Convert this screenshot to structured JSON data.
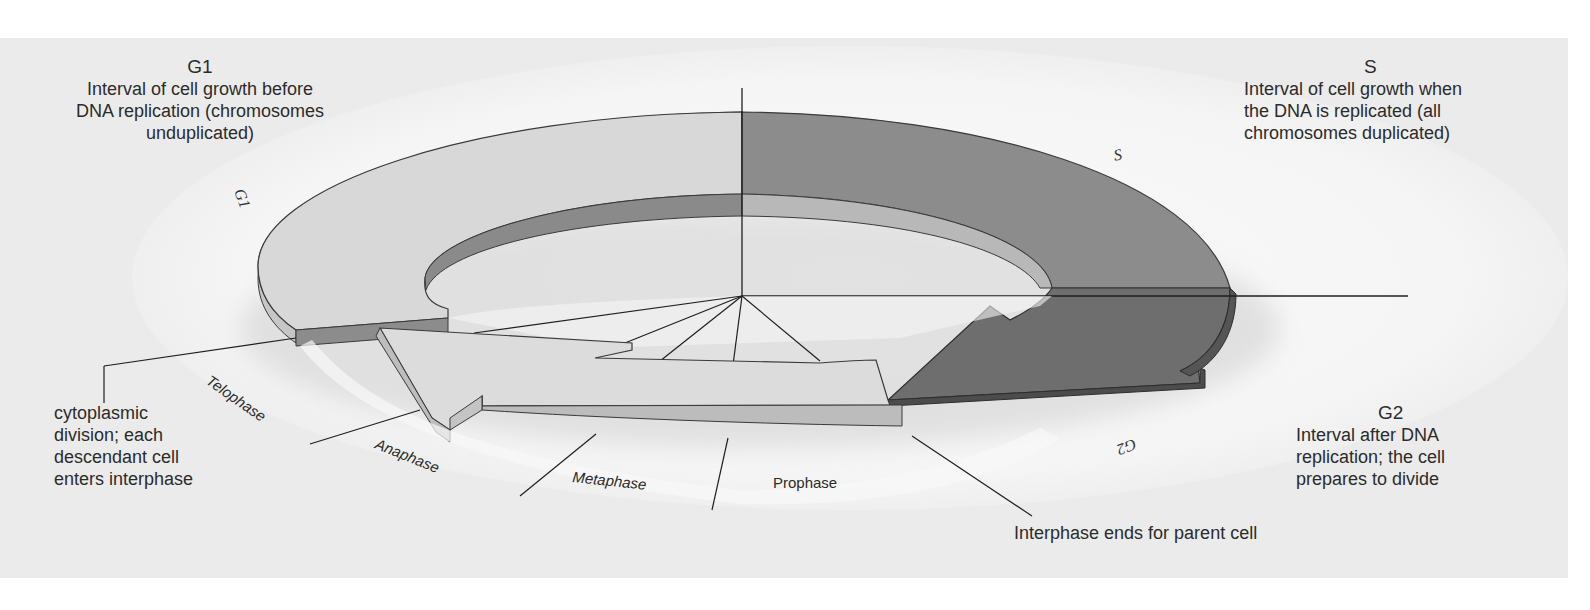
{
  "figure": {
    "colors": {
      "panel_bg": "#ebebeb",
      "halo": "#f7f7f7",
      "g1_top": "#d9d9d9",
      "g1_side": "#c8c8c8",
      "g1_inner": "#8e8e8e",
      "s_top": "#8c8c8c",
      "s_inner": "#b9b9b9",
      "g2_top": "#6f6f6f",
      "g2_side": "#4f4f4f",
      "mitosis_top": "#dcdcdc",
      "mitosis_side": "#bdbdbd",
      "line": "#1f1f1f"
    }
  },
  "annotations": {
    "g1": {
      "heading": "G1",
      "lines": [
        "Interval of cell growth before",
        "DNA replication (chromosomes",
        "unduplicated)"
      ]
    },
    "s": {
      "heading": "S",
      "lines": [
        "Interval of cell growth when",
        "the DNA is replicated (all",
        "chromosomes duplicated)"
      ]
    },
    "g2": {
      "heading": "G2",
      "lines": [
        "Interval after DNA",
        "replication; the cell",
        "prepares to divide"
      ]
    },
    "cytokinesis": {
      "lines": [
        "cytoplasmic",
        "division; each",
        "descendant cell",
        "enters interphase"
      ]
    },
    "interphase_end": {
      "text": "Interphase ends for parent cell"
    }
  },
  "ring_labels": {
    "g1": "G1",
    "s": "S",
    "g2": "G2"
  },
  "mitosis_phases": [
    {
      "name": "Prophase"
    },
    {
      "name": "Metaphase"
    },
    {
      "name": "Anaphase"
    },
    {
      "name": "Telophase"
    }
  ]
}
